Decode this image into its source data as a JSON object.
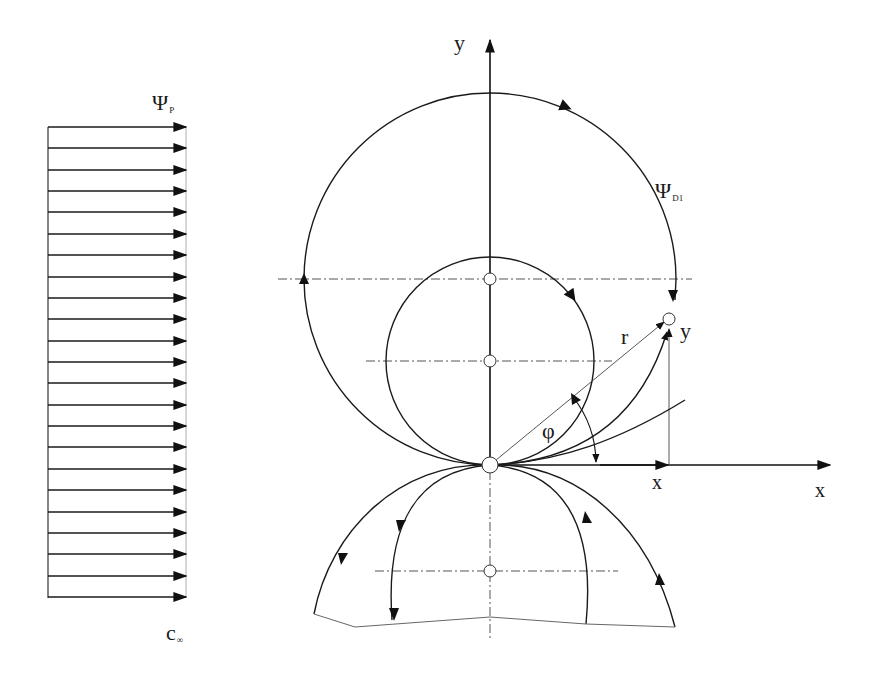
{
  "figure": {
    "uniform_flow": {
      "label_symbol": "Ψ",
      "label_subscript": "P",
      "velocity_label": "c",
      "velocity_subscript": "∞",
      "arrow_count": 23,
      "direction": "right"
    },
    "doublet_flow": {
      "label_symbol": "Ψ",
      "label_subscript": "D1"
    },
    "axes": {
      "x_label": "x",
      "y_label": "y"
    },
    "point": {
      "radius_label": "r",
      "angle_label": "φ",
      "x_coord_label": "x",
      "y_coord_label": "y"
    },
    "colors": {
      "line": "#1a1a1a",
      "thin_line": "#444444",
      "centerline": "#555555",
      "background": "#ffffff"
    }
  }
}
